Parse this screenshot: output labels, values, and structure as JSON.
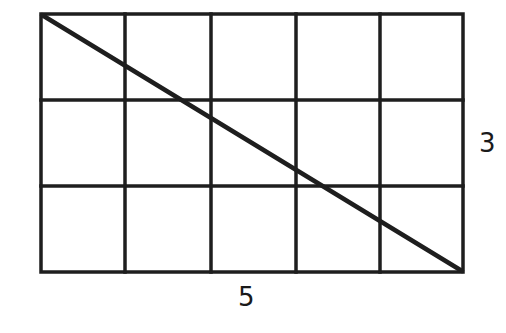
{
  "diagram": {
    "type": "grid-with-diagonal",
    "columns": 5,
    "rows": 3,
    "stroke_color": "#1e1e1e",
    "background": "#ffffff",
    "diagonal": {
      "from": "top-left",
      "to": "bottom-right"
    },
    "labels": {
      "width": "5",
      "height": "3"
    }
  }
}
